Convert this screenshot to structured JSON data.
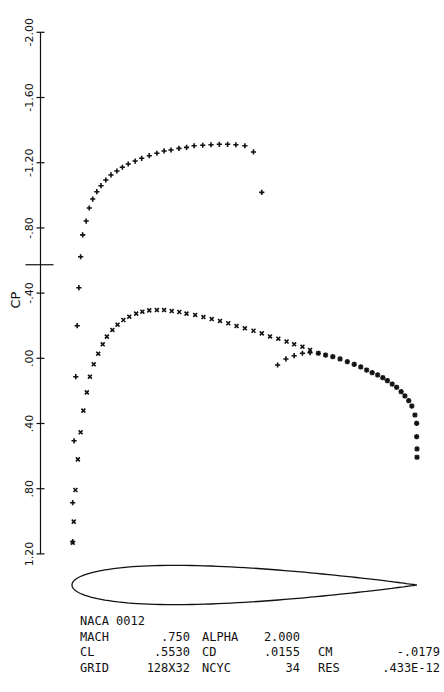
{
  "chart_data": {
    "type": "scatter",
    "title": "NACA 0012",
    "xlabel": "",
    "ylabel": "CP",
    "ylim": [
      -2.0,
      1.2
    ],
    "y_inverted": true,
    "xlim": [
      0.0,
      1.0
    ],
    "yticks": [
      -2.0,
      -1.6,
      -1.2,
      -0.8,
      -0.4,
      0.0,
      0.4,
      0.8,
      1.2
    ],
    "ytick_labels": [
      "-2.00",
      "-1.60",
      "-1.20",
      "-.80",
      "-.40",
      ".00",
      ".40",
      ".80",
      "1.20"
    ],
    "cp_critical": -0.574,
    "grid": false,
    "legend": "none",
    "series": [
      {
        "name": "upper surface",
        "marker": "plus",
        "x": [
          0.002,
          0.002,
          0.006,
          0.011,
          0.015,
          0.02,
          0.025,
          0.031,
          0.041,
          0.05,
          0.06,
          0.072,
          0.084,
          0.098,
          0.113,
          0.13,
          0.146,
          0.163,
          0.183,
          0.202,
          0.224,
          0.246,
          0.267,
          0.287,
          0.31,
          0.332,
          0.354,
          0.379,
          0.403,
          0.427,
          0.451,
          0.475,
          0.501,
          0.526,
          0.55,
          0.596,
          0.62,
          0.644,
          0.668,
          0.69,
          0.714,
          0.735,
          0.756,
          0.777,
          0.798,
          0.818,
          0.837,
          0.854,
          0.87,
          0.886,
          0.901,
          0.914,
          0.928,
          0.941,
          0.954,
          0.965,
          0.976,
          0.985,
          0.994,
          0.999,
          0.999,
          1.0,
          1.0
        ],
        "y": [
          1.125,
          0.886,
          0.506,
          0.113,
          -0.2,
          -0.433,
          -0.623,
          -0.757,
          -0.842,
          -0.922,
          -0.977,
          -1.022,
          -1.059,
          -1.094,
          -1.125,
          -1.149,
          -1.172,
          -1.192,
          -1.21,
          -1.227,
          -1.243,
          -1.258,
          -1.272,
          -1.278,
          -1.288,
          -1.294,
          -1.304,
          -1.307,
          -1.31,
          -1.313,
          -1.313,
          -1.31,
          -1.304,
          -1.266,
          -1.018,
          0.041,
          0.004,
          -0.016,
          -0.031,
          -0.034,
          -0.031,
          -0.02,
          -0.01,
          0.004,
          0.021,
          0.037,
          0.053,
          0.072,
          0.088,
          0.102,
          0.119,
          0.137,
          0.158,
          0.178,
          0.205,
          0.231,
          0.26,
          0.293,
          0.348,
          0.399,
          0.481,
          0.556,
          0.607
        ]
      },
      {
        "name": "lower surface",
        "marker": "cross",
        "x": [
          0.002,
          0.005,
          0.01,
          0.017,
          0.025,
          0.033,
          0.043,
          0.052,
          0.063,
          0.076,
          0.089,
          0.101,
          0.117,
          0.132,
          0.149,
          0.166,
          0.186,
          0.204,
          0.224,
          0.246,
          0.267,
          0.289,
          0.311,
          0.332,
          0.357,
          0.381,
          0.405,
          0.429,
          0.453,
          0.477,
          0.501,
          0.526,
          0.55,
          0.574,
          0.598,
          0.622,
          0.644,
          0.668,
          0.69,
          0.714,
          0.735,
          0.756,
          0.777,
          0.798,
          0.818,
          0.837,
          0.854,
          0.87,
          0.886,
          0.901,
          0.914,
          0.928,
          0.941,
          0.954,
          0.965,
          0.976,
          0.985,
          0.994,
          0.999,
          0.999,
          1.0,
          1.0
        ],
        "y": [
          1.131,
          1.002,
          0.808,
          0.62,
          0.454,
          0.321,
          0.209,
          0.113,
          0.037,
          -0.028,
          -0.086,
          -0.133,
          -0.174,
          -0.206,
          -0.235,
          -0.255,
          -0.274,
          -0.286,
          -0.294,
          -0.296,
          -0.296,
          -0.29,
          -0.284,
          -0.274,
          -0.266,
          -0.253,
          -0.241,
          -0.229,
          -0.215,
          -0.198,
          -0.184,
          -0.169,
          -0.153,
          -0.134,
          -0.12,
          -0.103,
          -0.086,
          -0.071,
          -0.051,
          -0.031,
          -0.02,
          -0.01,
          0.004,
          0.021,
          0.037,
          0.053,
          0.072,
          0.088,
          0.102,
          0.119,
          0.137,
          0.158,
          0.178,
          0.205,
          0.231,
          0.26,
          0.293,
          0.348,
          0.399,
          0.481,
          0.556,
          0.607
        ]
      }
    ],
    "airfoil": {
      "name": "NACA 0012",
      "thickness_ratio": 0.12
    }
  },
  "info": {
    "title": "NACA 0012",
    "rows": [
      [
        {
          "k": "MACH",
          "v": ".750"
        },
        {
          "k": "ALPHA",
          "v": "2.000"
        }
      ],
      [
        {
          "k": "CL",
          "v": ".5530"
        },
        {
          "k": "CD",
          "v": ".0155"
        },
        {
          "k": "CM",
          "v": "-.0179"
        }
      ],
      [
        {
          "k": "GRID",
          "v": "128X32"
        },
        {
          "k": "NCYC",
          "v": "34"
        },
        {
          "k": "RES",
          "v": ".433E-12"
        }
      ]
    ]
  }
}
